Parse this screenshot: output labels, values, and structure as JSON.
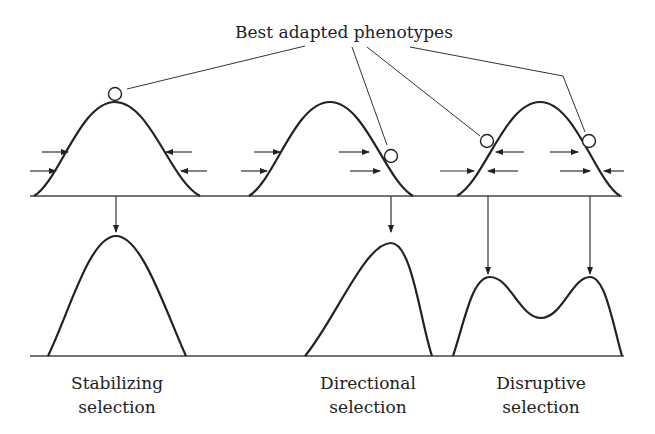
{
  "title": "Best adapted phenotypes",
  "panels": [
    {
      "label_line1": "Stabilizing",
      "label_line2": "selection"
    },
    {
      "label_line1": "Directional",
      "label_line2": "selection"
    },
    {
      "label_line1": "Disruptive",
      "label_line2": "selection"
    }
  ],
  "colors": {
    "ink": "#222222",
    "background": "#ffffff"
  }
}
